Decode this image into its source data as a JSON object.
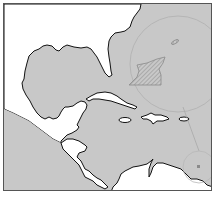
{
  "map": {
    "region": "Gulf of Mexico and Caribbean Sea",
    "colors": {
      "water": "#c8c8c8",
      "land": "#ffffff",
      "coastline": "#111111",
      "frame": "#555555",
      "highlight_circle": "#b4b4b4",
      "hatched_area": "#9a9a9a"
    },
    "features": {
      "large_circle": "inset-circle-north-atlantic",
      "hatched_region": "highlighted-area",
      "small_ellipse": "island-marker",
      "connector_line": "leader-line",
      "small_circle": "inset-circle-south-caribbean"
    }
  }
}
